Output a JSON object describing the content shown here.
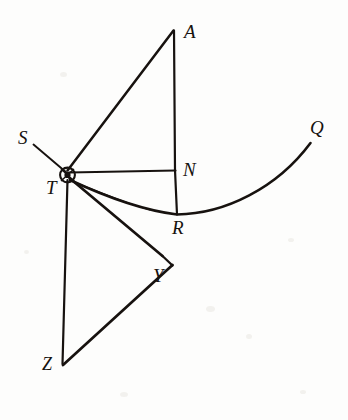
{
  "figure": {
    "kind": "geometric-diagram",
    "title": "",
    "background_color": "#fdfdfc",
    "ink_color": "#17120f",
    "width": 348,
    "height": 420
  },
  "points": [
    {
      "id": "A",
      "label": "A",
      "x": 174,
      "y": 30,
      "label_x": 184,
      "label_y": 24
    },
    {
      "id": "S",
      "label": "S",
      "x": 33,
      "y": 145,
      "label_x": 18,
      "label_y": 130
    },
    {
      "id": "T",
      "label": "T",
      "x": 66,
      "y": 173,
      "label_x": 46,
      "label_y": 180
    },
    {
      "id": "N",
      "label": "N",
      "x": 175,
      "y": 170,
      "label_x": 183,
      "label_y": 162
    },
    {
      "id": "R",
      "label": "R",
      "x": 177,
      "y": 214,
      "label_x": 174,
      "label_y": 219
    },
    {
      "id": "Q",
      "label": "Q",
      "x": 310,
      "y": 143,
      "label_x": 311,
      "label_y": 120
    },
    {
      "id": "Y",
      "label": "Y",
      "x": 162,
      "y": 256,
      "label_x": 154,
      "label_y": 267
    },
    {
      "id": "Z",
      "label": "Z",
      "x": 62,
      "y": 364,
      "label_x": 43,
      "label_y": 357
    }
  ],
  "segments": [
    {
      "name": "segment-S-T",
      "from": "S",
      "to": "T",
      "style": "solid",
      "weight": 1.9
    },
    {
      "name": "segment-T-A",
      "from": "T",
      "to": "A",
      "style": "solid",
      "weight": 2.4
    },
    {
      "name": "segment-A-N",
      "from": "A",
      "to": "N",
      "style": "solid",
      "weight": 2.2
    },
    {
      "name": "segment-N-R",
      "from": "N",
      "to": "R",
      "style": "solid",
      "weight": 2.2
    },
    {
      "name": "segment-T-N",
      "from": "T",
      "to": "N",
      "style": "solid",
      "weight": 2.0
    },
    {
      "name": "segment-T-Y",
      "from": "T",
      "to": "Y",
      "style": "solid",
      "weight": 2.6
    },
    {
      "name": "segment-T-Z",
      "from": "T",
      "to": "Z",
      "style": "solid",
      "weight": 2.1
    },
    {
      "name": "segment-Z-Y",
      "from": "Z",
      "to": "Y",
      "style": "solid",
      "weight": 2.6
    }
  ],
  "curve": {
    "name": "parabolic-arc-T-R-Q",
    "through": [
      "T",
      "R",
      "Q"
    ],
    "vertex": "R",
    "description": "concave-up arc rising from T through vertex R to Q"
  },
  "marks": [
    {
      "name": "right-angle-tick-at-Y",
      "at": "Y",
      "kind": "tick"
    },
    {
      "name": "node-blob-at-T",
      "at": "T",
      "kind": "filled-node"
    }
  ],
  "labels": {
    "A": "A",
    "S": "S",
    "T": "T",
    "N": "N",
    "R": "R",
    "Q": "Q",
    "Y": "Y",
    "Z": "Z"
  },
  "label_sizes": {
    "A": 19,
    "S": 19,
    "T": 19,
    "N": 19,
    "R": 19,
    "Q": 19,
    "Y": 19,
    "Z": 18
  }
}
